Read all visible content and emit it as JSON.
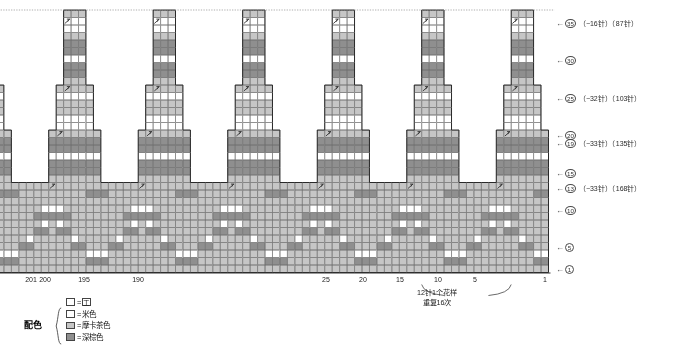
{
  "chart_data": {
    "type": "table",
    "title": "",
    "grid": {
      "cell_w": 7.46,
      "cell_h": 7.5,
      "rows": 35,
      "cols": 201,
      "origin_x_right": 548.5,
      "origin_y_bottom": 272.5
    },
    "colors": {
      "beige": "#ffffff",
      "mocha": "#c6c6c6",
      "dark_brown": "#8f8f8f",
      "grid_line": "#6e6e6e",
      "outline": "#2a2a2a",
      "dotted": "#9a9a9a"
    },
    "pattern_repeat_stitches": 12,
    "pattern_repeat_count": 16
  },
  "row_labels": [
    {
      "row": 35,
      "circle": "35",
      "note": "（−16针）（87针）",
      "y": 22
    },
    {
      "row": 30,
      "circle": "30",
      "note": "",
      "y": 59
    },
    {
      "row": 25,
      "circle": "25",
      "note": "（−32针）（103针）",
      "y": 97
    },
    {
      "row": 20,
      "circle": "20",
      "note": "",
      "y": 134
    },
    {
      "row": 19,
      "circle": "19",
      "note": "（−33针）（135针）",
      "y": 142
    },
    {
      "row": 15,
      "circle": "15",
      "note": "",
      "y": 172
    },
    {
      "row": 13,
      "circle": "13",
      "note": "（−33针）（168针）",
      "y": 187
    },
    {
      "row": 10,
      "circle": "10",
      "note": "",
      "y": 209
    },
    {
      "row": 5,
      "circle": "5",
      "note": "",
      "y": 246
    },
    {
      "row": 1,
      "circle": "1",
      "note": "",
      "y": 268
    }
  ],
  "column_labels": [
    {
      "text": "201",
      "x": 31
    },
    {
      "text": "200",
      "x": 45
    },
    {
      "text": "195",
      "x": 84
    },
    {
      "text": "190",
      "x": 138
    },
    {
      "text": "25",
      "x": 326
    },
    {
      "text": "20",
      "x": 363
    },
    {
      "text": "15",
      "x": 400
    },
    {
      "text": "10",
      "x": 438
    },
    {
      "text": "5",
      "x": 475
    },
    {
      "text": "1",
      "x": 545
    }
  ],
  "repeat_annotation": {
    "line1": "12针1个花样",
    "line2": "重复16次",
    "x": 437,
    "y": 288
  },
  "legend": {
    "title": "配色",
    "equals": "=",
    "symbol_row": {
      "swatch_color": "#ffffff",
      "symbol": "工"
    },
    "items": [
      {
        "swatch_color": "#ffffff",
        "label": "米色"
      },
      {
        "swatch_color": "#c6c6c6",
        "label": "摩卡茶色"
      },
      {
        "swatch_color": "#8f8f8f",
        "label": "深棕色"
      }
    ]
  }
}
